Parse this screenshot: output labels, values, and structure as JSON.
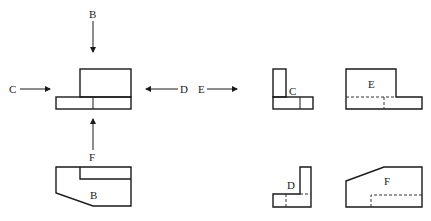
{
  "diagram": {
    "arrows": [
      {
        "label": "B",
        "direction": "down"
      },
      {
        "label": "C",
        "direction": "right"
      },
      {
        "label": "D",
        "direction": "left"
      },
      {
        "label": "E",
        "direction": "right"
      },
      {
        "label": "F",
        "direction": "up"
      }
    ],
    "views": [
      {
        "id": "C",
        "label": "C"
      },
      {
        "id": "E",
        "label": "E"
      },
      {
        "id": "B",
        "label": "B"
      },
      {
        "id": "D",
        "label": "D"
      },
      {
        "id": "F",
        "label": "F"
      }
    ],
    "colors": {
      "line": "#1a1a1a",
      "background": "#ffffff"
    }
  }
}
